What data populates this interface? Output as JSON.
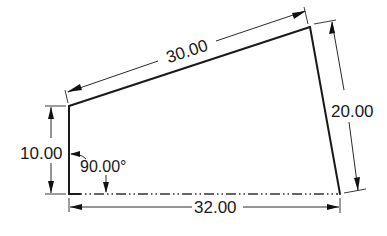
{
  "drawing": {
    "type": "2D dimensioned sketch",
    "shape": "quadrilateral",
    "colors": {
      "line": "#1a1a1a",
      "background": "#ffffff"
    },
    "dimensions": {
      "top_edge": {
        "label": "30.00",
        "kind": "aligned-length"
      },
      "right_edge": {
        "label": "20.00",
        "kind": "aligned-length"
      },
      "left_edge": {
        "label": "10.00",
        "kind": "vertical-length"
      },
      "bottom_edge": {
        "label": "32.00",
        "kind": "horizontal-length"
      },
      "bottom_left_angle": {
        "label": "90.00°",
        "kind": "angle"
      }
    },
    "construction_lines": [
      {
        "name": "bottom-centerline",
        "style": "dash-dot-dot"
      }
    ]
  }
}
